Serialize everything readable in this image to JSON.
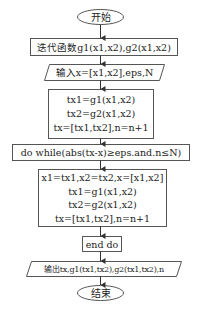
{
  "flowchart": {
    "start": "开始",
    "iter_funcs": "迭代函数g1(x1,x2),g2(x1,x2)",
    "input": "输入x=[x1,x2],eps,N",
    "init_block": [
      "tx1=g1(x1,x2)",
      "tx2=g2(x1,x2)",
      "tx=[tx1,tx2],n=n+1"
    ],
    "loop_condition": "do while(abs(tx-x)≥eps.and.n≤N)",
    "loop_body": [
      "x1=tx1,x2=tx2,x=[x1,x2]",
      "tx1=g1(x1,x2)",
      "tx2=g2(x1,x2)",
      "tx=[tx1,tx2],n=n+1"
    ],
    "end_loop": "end do",
    "output": "输出tx,g1(tx1,tx2),g2(tx1,tx2),n",
    "end": "结束"
  },
  "colors": {
    "stroke": "#444444",
    "text": "#222222",
    "background": "#ffffff"
  }
}
